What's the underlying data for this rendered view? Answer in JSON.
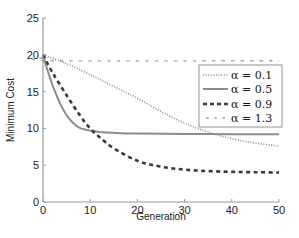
{
  "chart_data": {
    "type": "line",
    "title": "",
    "xlabel": "Generation",
    "ylabel": "Minimum Cost",
    "xlim": [
      0,
      50
    ],
    "ylim": [
      0,
      25
    ],
    "xticks": [
      0,
      10,
      20,
      30,
      40,
      50
    ],
    "yticks": [
      0,
      5,
      10,
      15,
      20,
      25
    ],
    "grid": false,
    "legend_position": "upper right",
    "series": [
      {
        "name": "α = 0.1",
        "style": "dotted",
        "color": "#8a8a8a",
        "x": [
          0,
          5,
          10,
          15,
          20,
          25,
          30,
          35,
          40,
          45,
          50
        ],
        "values": [
          20,
          18.8,
          17.3,
          15.7,
          14.1,
          12.3,
          10.7,
          9.5,
          8.6,
          8.0,
          7.6
        ]
      },
      {
        "name": "α = 0.5",
        "style": "solid",
        "color": "#8c8c8c",
        "x": [
          0,
          1,
          2,
          3,
          4,
          5,
          6,
          7,
          8,
          10,
          12,
          15,
          20,
          30,
          40,
          50
        ],
        "values": [
          20,
          17.8,
          15.9,
          14.3,
          12.9,
          11.8,
          11.0,
          10.4,
          10.0,
          9.7,
          9.5,
          9.4,
          9.3,
          9.25,
          9.2,
          9.2
        ]
      },
      {
        "name": "α = 0.9",
        "style": "dashed",
        "color": "#3a3a3a",
        "x": [
          0,
          2,
          5,
          8,
          10,
          12,
          15,
          20,
          25,
          30,
          35,
          40,
          45,
          50
        ],
        "values": [
          20,
          17.6,
          14.5,
          11.6,
          10.0,
          8.8,
          7.3,
          5.6,
          4.8,
          4.4,
          4.2,
          4.1,
          4.05,
          4.0
        ]
      },
      {
        "name": "α = 1.3",
        "style": "dashed-light",
        "color": "#a8a8a8",
        "x": [
          0,
          2,
          50
        ],
        "values": [
          19.6,
          19.2,
          19.2
        ]
      }
    ]
  },
  "axes": {
    "xlabel": "Generation",
    "ylabel": "Minimum Cost",
    "xtick_labels": [
      "0",
      "10",
      "20",
      "30",
      "40",
      "50"
    ],
    "ytick_labels": [
      "0",
      "5",
      "10",
      "15",
      "20",
      "25"
    ]
  },
  "legend": {
    "items": [
      {
        "label": "α = 0.1"
      },
      {
        "label": "α = 0.5"
      },
      {
        "label": "α = 0.9"
      },
      {
        "label": "α = 1.3"
      }
    ]
  }
}
